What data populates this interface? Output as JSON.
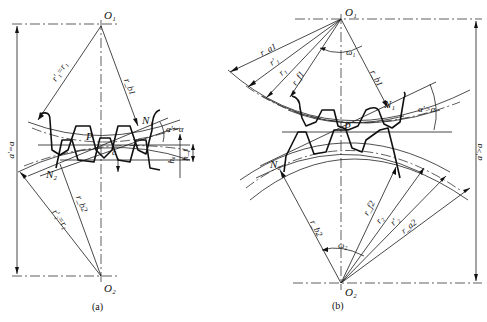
{
  "figure": {
    "panels": [
      {
        "caption": "(a)",
        "title": "Standard center distance meshing",
        "labels": {
          "center_top": "O₁",
          "center_bottom": "O₂",
          "pitch_point": "P",
          "contact_start": "N₁",
          "contact_end": "N₂",
          "radius_pitch_1": "r′₁=r₁",
          "radius_base_1": "r_b1",
          "radius_pitch_2": "r′₂=r₂",
          "radius_base_2": "r_b2",
          "pressure_angle": "α′=α",
          "center_distance": "a′=a",
          "clearance": "c",
          "addendum": "hₐ",
          "dedendum": "h_f"
        }
      },
      {
        "caption": "(b)",
        "title": "Increased center distance meshing",
        "labels": {
          "center_top": "O₁",
          "center_bottom": "O₂",
          "pitch_point": "P",
          "contact_start": "N₁",
          "contact_end": "N₂",
          "radius_addendum_1": "r_a1",
          "radius_operating_pitch_1": "r′₁",
          "radius_pitch_1": "r₁",
          "radius_root_1": "r_f1",
          "radius_base_1": "r_b1",
          "angular_velocity_1": "ω₁",
          "radius_base_2": "r_b2",
          "radius_root_2": "r_f2",
          "radius_pitch_2": "r₂",
          "radius_operating_pitch_2": "r′₂",
          "radius_addendum_2": "r_a2",
          "angular_velocity_2": "ω₂",
          "pressure_angle": "α′>α",
          "center_distance": "a′>a"
        }
      }
    ]
  }
}
